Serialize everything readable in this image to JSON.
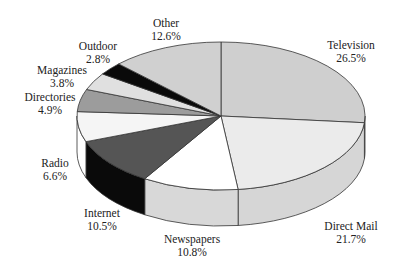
{
  "chart_data": {
    "type": "pie",
    "style": "3d",
    "title": "",
    "start_angle": "12 o'clock, clockwise",
    "slices": [
      {
        "label": "Television",
        "value": 26.5,
        "pct_text": "26.5%",
        "top": "#cfcfcf",
        "side": "#c4c4c4",
        "lx": 351,
        "ly": 39
      },
      {
        "label": "Direct Mail",
        "value": 21.7,
        "pct_text": "21.7%",
        "top": "#ebebeb",
        "side": "#d6d6d6",
        "lx": 351,
        "ly": 220
      },
      {
        "label": "Newspapers",
        "value": 10.8,
        "pct_text": "10.8%",
        "top": "#ffffff",
        "side": "#d8d8d8",
        "lx": 192,
        "ly": 233
      },
      {
        "label": "Internet",
        "value": 10.5,
        "pct_text": "10.5%",
        "top": "#555555",
        "side": "#0a0a0a",
        "lx": 102,
        "ly": 207
      },
      {
        "label": "Radio",
        "value": 6.6,
        "pct_text": "6.6%",
        "top": "#f5f5f5",
        "side": "#ffffff",
        "lx": 55,
        "ly": 157
      },
      {
        "label": "Directories",
        "value": 4.9,
        "pct_text": "4.9%",
        "top": "#9c9c9c",
        "side": "#9c9c9c",
        "lx": 50,
        "ly": 91
      },
      {
        "label": "Magazines",
        "value": 3.8,
        "pct_text": "3.8%",
        "top": "#e0e0e0",
        "side": "#e0e0e0",
        "lx": 62,
        "ly": 64
      },
      {
        "label": "Outdoor",
        "value": 2.8,
        "pct_text": "2.8%",
        "top": "#0a0a0a",
        "side": "#0a0a0a",
        "lx": 98,
        "ly": 40
      },
      {
        "label": "Other",
        "value": 12.6,
        "pct_text": "12.6%",
        "top": "#d0d0d0",
        "side": "#d0d0d0",
        "lx": 166,
        "ly": 17
      }
    ],
    "geometry": {
      "cx": 221,
      "cy": 116,
      "rx": 144,
      "ry": 74,
      "depth": 36
    },
    "legend": "none (labels placed beside slices)"
  }
}
